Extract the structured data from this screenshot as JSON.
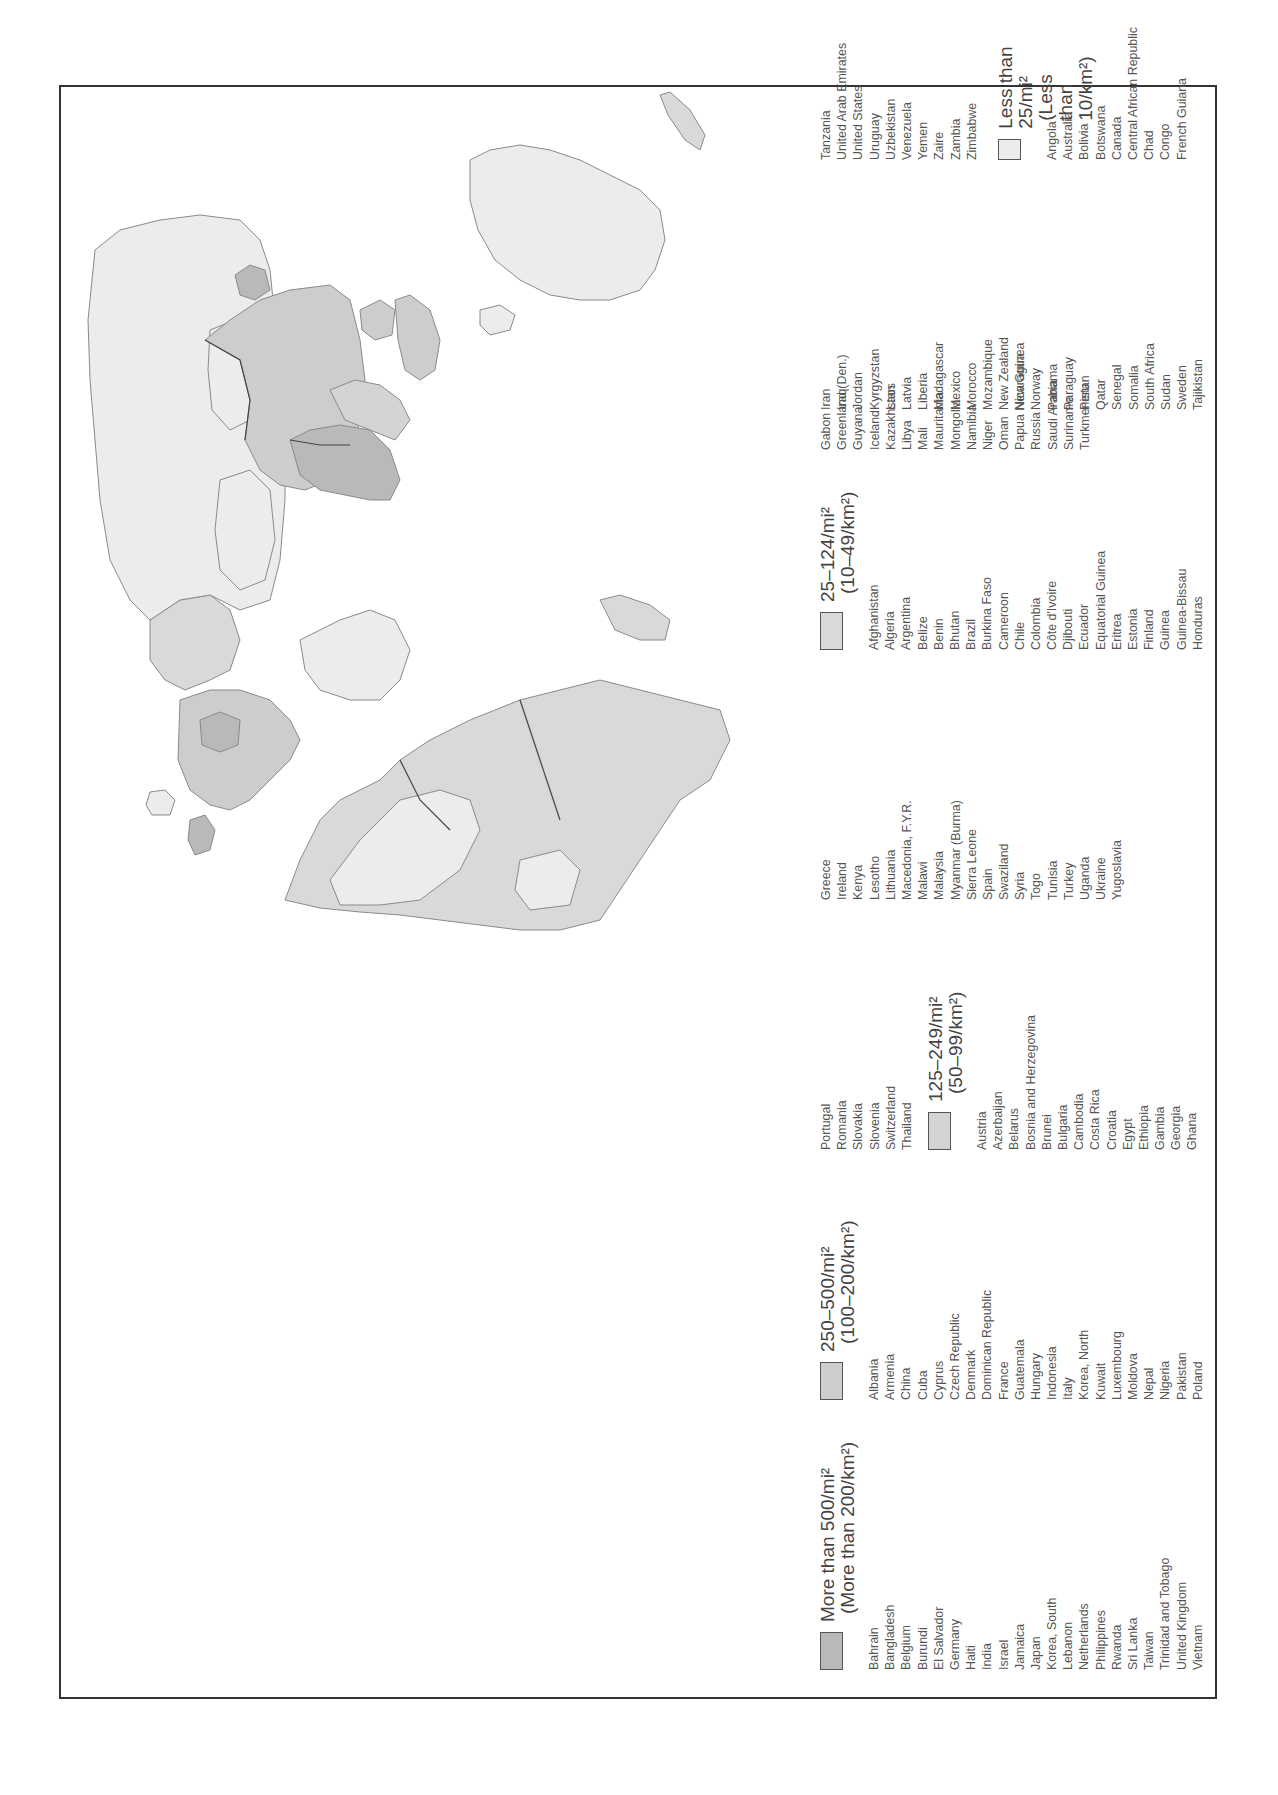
{
  "map": {
    "title": "World Population Density",
    "orientation": "rotated 90 degrees counterclockwise",
    "colors": {
      "more_than_500": "#b9b9b9",
      "250_500": "#cdcdcd",
      "125_249": "#d4d4d4",
      "25_124": "#d9d9d9",
      "less_than_25": "#ececec",
      "border": "#444444",
      "coast": "#8a8a8a",
      "water": "#ffffff"
    }
  },
  "legend": {
    "categories": [
      {
        "id": "more_than_500",
        "label": "More than 500/mi²",
        "sublabel": "(More than 200/km²)",
        "color": "#b9b9b9",
        "countries": [
          "Bahrain",
          "Bangladesh",
          "Belgium",
          "Burundi",
          "El Salvador",
          "Germany",
          "Haiti",
          "India",
          "Israel",
          "Jamaica",
          "Japan",
          "Korea, South",
          "Lebanon",
          "Netherlands",
          "Philippines",
          "Rwanda",
          "Sri Lanka",
          "Taiwan",
          "Trinidad and Tobago",
          "United Kingdom",
          "Vietnam"
        ]
      },
      {
        "id": "250_500",
        "label": "250–500/mi²",
        "sublabel": "(100–200/km²)",
        "color": "#cdcdcd",
        "countries": [
          "Albania",
          "Armenia",
          "China",
          "Cuba",
          "Cyprus",
          "Czech Republic",
          "Denmark",
          "Dominican Republic",
          "France",
          "Guatemala",
          "Hungary",
          "Indonesia",
          "Italy",
          "Korea, North",
          "Kuwait",
          "Luxembourg",
          "Moldova",
          "Nepal",
          "Nigeria",
          "Pakistan",
          "Poland",
          "Portugal",
          "Romania",
          "Slovakia",
          "Slovenia",
          "Switzerland",
          "Thailand"
        ]
      },
      {
        "id": "125_249",
        "label": "125–249/mi²",
        "sublabel": "(50–99/km²)",
        "color": "#d4d4d4",
        "countries": [
          "Austria",
          "Azerbaijan",
          "Belarus",
          "Bosnia and Herzegovina",
          "Brunei",
          "Bulgaria",
          "Cambodia",
          "Costa Rica",
          "Croatia",
          "Egypt",
          "Ethiopia",
          "Gambia",
          "Georgia",
          "Ghana",
          "Greece",
          "Ireland",
          "Kenya",
          "Lesotho",
          "Lithuania",
          "Macedonia, F.Y.R.",
          "Malawi",
          "Malaysia",
          "Myanmar (Burma)",
          "Sierra Leone",
          "Spain",
          "Swaziland",
          "Syria",
          "Togo",
          "Tunisia",
          "Turkey",
          "Uganda",
          "Ukraine",
          "Yugoslavia"
        ]
      },
      {
        "id": "25_124",
        "label": "25–124/mi²",
        "sublabel": "(10–49/km²)",
        "color": "#d9d9d9",
        "countries": [
          "Afghanistan",
          "Algeria",
          "Argentina",
          "Belize",
          "Benin",
          "Bhutan",
          "Brazil",
          "Burkina Faso",
          "Cameroon",
          "Chile",
          "Colombia",
          "Côte d'Ivoire",
          "Djibouti",
          "Ecuador",
          "Equatorial Guinea",
          "Eritrea",
          "Estonia",
          "Finland",
          "Guinea",
          "Guinea-Bissau",
          "Honduras",
          "Iran",
          "Iraq",
          "Jordan",
          "Kyrgyzstan",
          "Laos",
          "Latvia",
          "Liberia",
          "Madagascar",
          "Mexico",
          "Morocco",
          "Mozambique",
          "New Zealand",
          "Nicaragua",
          "Norway",
          "Panama",
          "Paraguay",
          "Peru",
          "Qatar",
          "Senegal",
          "Somalia",
          "South Africa",
          "Sudan",
          "Sweden",
          "Tajikistan",
          "Tanzania",
          "United Arab Emirates",
          "United States",
          "Uruguay",
          "Uzbekistan",
          "Venezuela",
          "Yemen",
          "Zaire",
          "Zambia",
          "Zimbabwe"
        ]
      },
      {
        "id": "less_than_25",
        "label": "Less than 25/mi²",
        "sublabel": "(Less than 10/km²)",
        "color": "#ececec",
        "countries": [
          "Angola",
          "Australia",
          "Bolivia",
          "Botswana",
          "Canada",
          "Central African Republic",
          "Chad",
          "Congo",
          "French Guiana",
          "Gabon",
          "Greenland (Den.)",
          "Guyana",
          "Iceland",
          "Kazakhstan",
          "Libya",
          "Mali",
          "Mauritania",
          "Mongolia",
          "Namibia",
          "Niger",
          "Oman",
          "Papua New Guinea",
          "Russia",
          "Saudi Arabia",
          "Suriname",
          "Turkmenistan"
        ]
      }
    ]
  }
}
